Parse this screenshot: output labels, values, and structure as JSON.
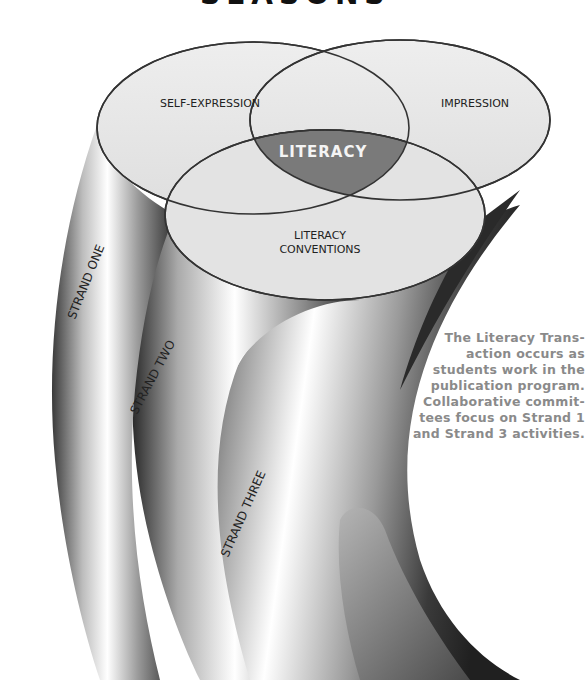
{
  "title_cropped": "SEASONS",
  "venn": {
    "circles": [
      {
        "label": "SELF-EXPRESSION"
      },
      {
        "label": "IMPRESSION"
      },
      {
        "label": "LITERACY CONVENTIONS",
        "lines": [
          "LITERACY",
          "CONVENTIONS"
        ]
      }
    ],
    "center_label": "LITERACY"
  },
  "strands": [
    {
      "label": "STRAND ONE"
    },
    {
      "label": "STRAND TWO"
    },
    {
      "label": "STRAND THREE"
    }
  ],
  "caption": {
    "lines": [
      "The Literacy Trans-",
      "action occurs as",
      "students work in the",
      "publication program.",
      "Collaborative commit-",
      "tees focus on Strand 1",
      "and Strand 3 activities."
    ]
  },
  "colors": {
    "ellipse_fill": "#e6e6e6",
    "center_fill": "#7a7a7a",
    "outline": "#333333",
    "caption_text": "#8a8a8a"
  }
}
